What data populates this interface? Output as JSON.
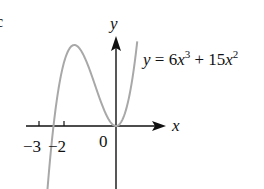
{
  "figure": {
    "equation": {
      "lhs": "y",
      "eq": " = 6",
      "x1": "x",
      "exp1": "3",
      "plus": " + 15",
      "x2": "x",
      "exp2": "2"
    },
    "axes": {
      "x_label": "x",
      "y_label": "y",
      "origin_label": "0",
      "ticks": [
        "−3",
        "−2"
      ]
    },
    "colors": {
      "axis": "#111111",
      "curve": "#a8a8a8",
      "text": "#111111"
    },
    "partial_label_left": "c"
  },
  "chart_data": {
    "type": "line",
    "title": "",
    "function": "y = 6x^3 + 15x^2",
    "xlabel": "x",
    "ylabel": "y",
    "x_ticks": [
      -3,
      -2,
      0
    ],
    "roots": [
      -2.5,
      0
    ],
    "local_max": {
      "x": -1.667,
      "y": 13.89
    },
    "local_min": {
      "x": 0,
      "y": 0
    },
    "xlim": [
      -3.1,
      0.85
    ],
    "grid": false
  }
}
